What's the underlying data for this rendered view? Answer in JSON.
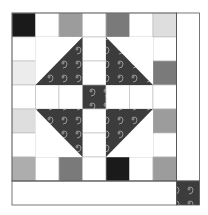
{
  "palette": {
    "white": "#ffffff",
    "black": "#1a1a1a",
    "dark_gray": "#7a7a7a",
    "mid_gray": "#9c9c9c",
    "gray": "#adadad",
    "light_gray": "#dedede",
    "pale_gray": "#ececec",
    "fabric": "#3c3c3c",
    "spiral": "#bdbdbd",
    "seam": "#555555",
    "inner_seam": "#b8b8b8"
  },
  "grid": {
    "rows": 7,
    "cols": 7,
    "cells": [
      [
        "black",
        "white",
        "mid_gray",
        "white",
        "dark_gray",
        "white",
        "light_gray"
      ],
      [
        "white",
        "tri",
        "tri",
        "white",
        "tri",
        "tri",
        "white"
      ],
      [
        "pale_gray",
        "tri",
        "tri",
        "white",
        "tri",
        "tri",
        "dark_gray"
      ],
      [
        "white",
        "white",
        "white",
        "fabric",
        "white",
        "white",
        "white"
      ],
      [
        "light_gray",
        "tri",
        "tri",
        "white",
        "tri",
        "tri",
        "mid_gray"
      ],
      [
        "white",
        "tri",
        "tri",
        "white",
        "tri",
        "tri",
        "white"
      ],
      [
        "gray",
        "white",
        "dark_gray",
        "white",
        "black",
        "white",
        "mid_gray"
      ]
    ]
  },
  "triangle_blocks": [
    {
      "name": "top-left-half-square-triangle",
      "row": 1,
      "col": 1,
      "dark_half": "bottom-right"
    },
    {
      "name": "top-right-half-square-triangle",
      "row": 1,
      "col": 4,
      "dark_half": "bottom-left"
    },
    {
      "name": "bottom-left-half-square-triangle",
      "row": 4,
      "col": 1,
      "dark_half": "top-right"
    },
    {
      "name": "bottom-right-half-square-triangle",
      "row": 4,
      "col": 4,
      "dark_half": "top-left"
    }
  ],
  "border": {
    "right_strip": "white",
    "bottom_strip": "white",
    "corner_square": "fabric"
  }
}
